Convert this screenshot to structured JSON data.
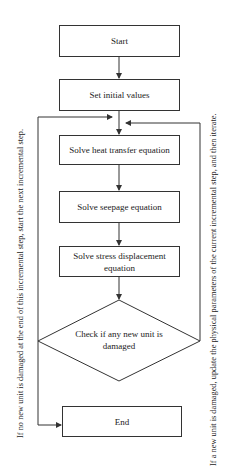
{
  "nodes": {
    "start": "Start",
    "init": "Set initial values",
    "heat": "Solve heat transfer equation",
    "seepage": "Solve seepage equation",
    "stress": "Solve stress displacement equation",
    "check": "Check if any new unit is damaged",
    "end": "End"
  },
  "annotations": {
    "left": "If no new unit is damaged at the end of this incremental step, start the next incremental step.",
    "right": "If a new unit is damaged, update the physical parameters of the current incremental step, and then iterate."
  },
  "colors": {
    "line": "#333333",
    "background": "#ffffff"
  }
}
